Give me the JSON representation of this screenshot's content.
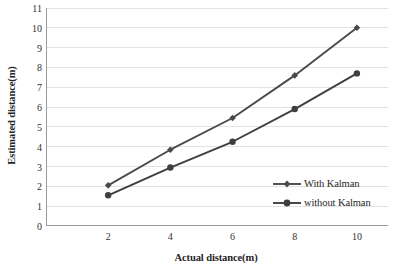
{
  "chart_data": {
    "type": "line",
    "title": "",
    "xlabel": "Actual distance(m)",
    "ylabel": "Estimated distance(m)",
    "x": [
      2,
      4,
      6,
      8,
      10
    ],
    "xlim": [
      0,
      11
    ],
    "ylim": [
      0,
      11
    ],
    "xticks": [
      "2",
      "4",
      "6",
      "8",
      "10"
    ],
    "yticks": [
      "0",
      "1",
      "2",
      "3",
      "4",
      "5",
      "6",
      "7",
      "8",
      "9",
      "10",
      "11"
    ],
    "grid": "horizontal",
    "legend_position": "inside-lower-right",
    "series": [
      {
        "name": "With Kalman",
        "marker": "diamond",
        "color": "#4a4a4a",
        "values": [
          2.05,
          3.85,
          5.45,
          7.6,
          10.0
        ]
      },
      {
        "name": "without Kalman",
        "marker": "circle",
        "color": "#3f3f3f",
        "values": [
          1.55,
          2.95,
          4.25,
          5.9,
          7.7
        ]
      }
    ]
  },
  "legend": {
    "items": [
      {
        "label": "With Kalman",
        "marker": "diamond-marker-icon"
      },
      {
        "label": "without Kalman",
        "marker": "circle-marker-icon"
      }
    ]
  },
  "colors": {
    "line": "#4a4a4a",
    "grid": "#e2e2e2",
    "axis": "#9a9a9a",
    "text": "#2b2b2b"
  }
}
